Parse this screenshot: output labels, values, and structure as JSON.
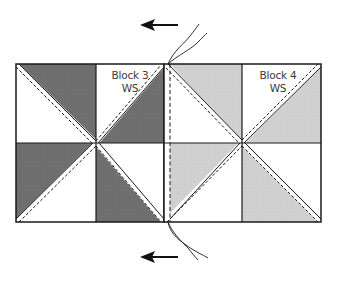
{
  "diagram": {
    "type": "quilt-block-sewing-diagram",
    "colors": {
      "dark_fabric": "#6e6e6e",
      "light_fabric": "#cfcfcf",
      "white": "#ffffff",
      "outline": "#1a1a1a",
      "dashed_stitch": "#1a1a1a",
      "label_text": "#3a3a3a"
    },
    "blocks": [
      {
        "id": "block-3",
        "label_line1": "Block 3",
        "label_line2": "WS",
        "fabric": "dark",
        "cells": [
          {
            "row": 0,
            "col": 0,
            "shaded_half": "top-right",
            "diagonal": "tl-br"
          },
          {
            "row": 0,
            "col": 1,
            "shaded_half": "bottom-right",
            "diagonal": "bl-tr"
          },
          {
            "row": 1,
            "col": 0,
            "shaded_half": "top-left",
            "diagonal": "bl-tr"
          },
          {
            "row": 1,
            "col": 1,
            "shaded_half": "bottom-left",
            "diagonal": "tl-br"
          }
        ]
      },
      {
        "id": "block-4",
        "label_line1": "Block 4",
        "label_line2": "WS",
        "fabric": "light",
        "cells": [
          {
            "row": 0,
            "col": 0,
            "shaded_half": "top-right",
            "diagonal": "tl-br"
          },
          {
            "row": 0,
            "col": 1,
            "shaded_half": "bottom-right",
            "diagonal": "bl-tr"
          },
          {
            "row": 1,
            "col": 0,
            "shaded_half": "top-left",
            "diagonal": "bl-tr"
          },
          {
            "row": 1,
            "col": 1,
            "shaded_half": "bottom-left",
            "diagonal": "tl-br"
          }
        ]
      }
    ],
    "arrows": [
      {
        "position": "top",
        "direction": "left"
      },
      {
        "position": "bottom",
        "direction": "left"
      }
    ],
    "threads": [
      {
        "position": "top",
        "count": 2
      },
      {
        "position": "bottom",
        "count": 2
      }
    ],
    "seam": {
      "style": "dashed",
      "orientation": "vertical"
    }
  }
}
